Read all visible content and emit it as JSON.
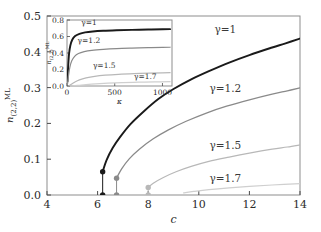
{
  "figure": {
    "background": "#ffffff",
    "width": 321,
    "height": 232
  },
  "chart_data": {
    "type": "line",
    "title": "",
    "subtitle": "",
    "xlabel": "c",
    "ylabel": "n_{(2,2)}^{ML}",
    "xlim": [
      4,
      14
    ],
    "ylim": [
      0.0,
      0.5
    ],
    "xticks": [
      4,
      6,
      8,
      10,
      12,
      14
    ],
    "xticklabels": [
      "4",
      "6",
      "8",
      "10",
      "12",
      "14"
    ],
    "yticks": [
      0.0,
      0.1,
      0.2,
      0.3,
      0.4,
      0.5
    ],
    "yticklabels": [
      "0.0",
      "0.1",
      "0.2",
      "0.3",
      "0.4",
      "0.5"
    ],
    "grid": false,
    "legend_position": "inline-annotations",
    "series": [
      {
        "name": "gamma=1",
        "label": "γ=1",
        "color": "#1a1a1a",
        "width": 1.9,
        "label_x": 11.05,
        "label_y": 0.452,
        "onset_c": 6.2,
        "onset_y": 0.065,
        "x": [
          6.2,
          6.35,
          6.6,
          6.9,
          7.3,
          7.8,
          8.4,
          9.0,
          9.7,
          10.4,
          11.2,
          12.0,
          12.9,
          13.4,
          14.0
        ],
        "y": [
          0.065,
          0.097,
          0.132,
          0.163,
          0.198,
          0.232,
          0.268,
          0.296,
          0.323,
          0.346,
          0.37,
          0.391,
          0.412,
          0.423,
          0.437
        ]
      },
      {
        "name": "gamma=1.2",
        "label": "γ=1.2",
        "color": "#8a8a8a",
        "width": 1.3,
        "label_x": 11.05,
        "label_y": 0.288,
        "onset_c": 6.75,
        "onset_y": 0.047,
        "x": [
          6.75,
          6.95,
          7.25,
          7.65,
          8.2,
          8.8,
          9.5,
          10.3,
          11.1,
          12.0,
          12.9,
          13.5,
          14.0
        ],
        "y": [
          0.047,
          0.073,
          0.101,
          0.128,
          0.157,
          0.182,
          0.206,
          0.229,
          0.248,
          0.266,
          0.282,
          0.291,
          0.299
        ]
      },
      {
        "name": "gamma=1.5",
        "label": "γ=1.5",
        "color": "#b8b8b8",
        "width": 1.2,
        "label_x": 11.05,
        "label_y": 0.128,
        "onset_c": 8.0,
        "onset_y": 0.021,
        "x": [
          8.0,
          8.2,
          8.6,
          9.1,
          9.7,
          10.4,
          11.2,
          12.0,
          12.9,
          13.5,
          14.0
        ],
        "y": [
          0.021,
          0.033,
          0.049,
          0.065,
          0.08,
          0.094,
          0.106,
          0.117,
          0.128,
          0.134,
          0.14
        ]
      },
      {
        "name": "gamma=1.7",
        "label": "γ=1.7",
        "color": "#cfcfcf",
        "width": 1.2,
        "label_x": 11.05,
        "label_y": 0.036,
        "onset_c": 9.4,
        "onset_y": 0.006,
        "x": [
          9.4,
          9.8,
          10.4,
          11.2,
          12.0,
          12.9,
          14.0
        ],
        "y": [
          0.006,
          0.01,
          0.015,
          0.02,
          0.024,
          0.028,
          0.032
        ]
      }
    ],
    "onset_markers": [
      {
        "series": "gamma=1",
        "c": 6.2,
        "y_upper": 0.065,
        "y_lower": 0.0,
        "color": "#1a1a1a"
      },
      {
        "series": "gamma=1.2",
        "c": 6.75,
        "y_upper": 0.047,
        "y_lower": 0.0,
        "color": "#8a8a8a"
      },
      {
        "series": "gamma=1.5",
        "c": 8.0,
        "y_upper": 0.021,
        "y_lower": 0.0,
        "color": "#b8b8b8"
      }
    ]
  },
  "inset_chart_data": {
    "type": "line",
    "xlabel": "κ",
    "ylabel": "n_{(2,2)}^{ML}",
    "xlim": [
      0,
      1100
    ],
    "ylim": [
      0.0,
      0.8
    ],
    "xticks": [
      0,
      500,
      1000
    ],
    "xticklabels": [
      "0",
      "500",
      "1000"
    ],
    "yticks": [
      0.0,
      0.2,
      0.4,
      0.6,
      0.8
    ],
    "yticklabels": [
      "0.0",
      "0.2",
      "0.4",
      "0.6",
      "0.8"
    ],
    "grid": false,
    "series": [
      {
        "name": "gamma=1",
        "label": "γ=1",
        "color": "#1a1a1a",
        "width": 1.9,
        "label_x": 230,
        "label_y": 0.735,
        "x": [
          5,
          12,
          22,
          35,
          55,
          85,
          130,
          190,
          270,
          380,
          520,
          680,
          850,
          1000,
          1080
        ],
        "y": [
          0.055,
          0.235,
          0.395,
          0.49,
          0.56,
          0.605,
          0.632,
          0.65,
          0.661,
          0.669,
          0.675,
          0.68,
          0.684,
          0.687,
          0.689
        ]
      },
      {
        "name": "gamma=1.2",
        "label": "γ=1.2",
        "color": "#8a8a8a",
        "width": 1.2,
        "label_x": 230,
        "label_y": 0.52,
        "x": [
          5,
          15,
          30,
          50,
          80,
          120,
          180,
          260,
          380,
          520,
          680,
          850,
          1000,
          1080
        ],
        "y": [
          0.022,
          0.12,
          0.228,
          0.305,
          0.36,
          0.393,
          0.416,
          0.432,
          0.444,
          0.453,
          0.459,
          0.464,
          0.468,
          0.47
        ]
      },
      {
        "name": "gamma=1.5",
        "label": "γ=1.5",
        "color": "#b8b8b8",
        "width": 1.2,
        "label_x": 390,
        "label_y": 0.215,
        "x": [
          20,
          45,
          80,
          130,
          200,
          290,
          400,
          540,
          700,
          870,
          1000,
          1080
        ],
        "y": [
          0.004,
          0.02,
          0.046,
          0.074,
          0.098,
          0.117,
          0.131,
          0.142,
          0.15,
          0.156,
          0.16,
          0.162
        ]
      },
      {
        "name": "gamma=1.7",
        "label": "γ=1.7",
        "color": "#cfcfcf",
        "width": 1.2,
        "label_x": 820,
        "label_y": 0.09,
        "x": [
          60,
          120,
          200,
          300,
          430,
          580,
          750,
          920,
          1080
        ],
        "y": [
          0.002,
          0.008,
          0.017,
          0.026,
          0.034,
          0.041,
          0.046,
          0.05,
          0.053
        ]
      }
    ]
  }
}
